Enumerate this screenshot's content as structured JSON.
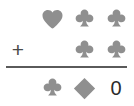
{
  "puzzle": {
    "type": "suit-symbol-addition",
    "operator": "+",
    "operator_name": "plus-sign",
    "colors": {
      "suit_gray": "#8f8f8f",
      "divider": "#5a5a5a",
      "operator": "#4a4a4a",
      "result_text": "#2b2b2b",
      "background": "#ffffff"
    },
    "rows": [
      {
        "row_name": "first-addend",
        "operator": "",
        "cells": [
          {
            "icon": "heart-icon",
            "label": "heart"
          },
          {
            "icon": "club-icon",
            "label": "club"
          },
          {
            "icon": "club-icon",
            "label": "club"
          }
        ]
      },
      {
        "row_name": "second-addend",
        "operator": "+",
        "cells": [
          {
            "icon": "empty",
            "label": ""
          },
          {
            "icon": "club-icon",
            "label": "club"
          },
          {
            "icon": "club-icon",
            "label": "club"
          }
        ]
      },
      {
        "row_name": "sum",
        "operator": "",
        "cells": [
          {
            "icon": "club-icon",
            "label": "club"
          },
          {
            "icon": "diamond-icon",
            "label": "diamond"
          },
          {
            "icon": "text",
            "label": "0"
          }
        ]
      }
    ],
    "result_value": "0"
  }
}
